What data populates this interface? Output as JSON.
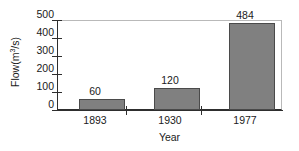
{
  "chart_data": {
    "type": "bar",
    "title": "",
    "subtitle": "",
    "xlabel": "Year",
    "ylabel": "Flow(m3/s)",
    "ylabel_base": "Flow(m",
    "ylabel_sup": "3",
    "ylabel_tail": "/s)",
    "categories": [
      "1893",
      "1930",
      "1977"
    ],
    "values": [
      60,
      120,
      484
    ],
    "value_labels": [
      "60",
      "120",
      "484"
    ],
    "series": [
      {
        "name": "Flow",
        "values": [
          60,
          120,
          484
        ]
      }
    ],
    "ylim": [
      0,
      500
    ],
    "xlim_note": "categorical",
    "ytick_values": [
      0,
      100,
      200,
      300,
      400,
      500
    ],
    "ytick_labels": [
      "0",
      "100",
      "200",
      "300",
      "400",
      "500"
    ],
    "grid": false,
    "legend": false,
    "legend_position": "none",
    "bar_color": "#808080",
    "bar_edge_color": "#4a4a4a",
    "axis_color": "#2e2e2e",
    "frame_color": "#b9b9b9",
    "background_color": "#ffffff",
    "text_color": "#1a1a1a"
  }
}
